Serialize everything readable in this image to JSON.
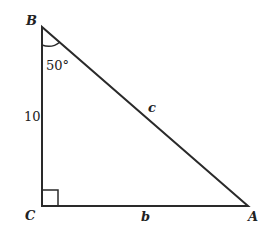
{
  "diagram": {
    "type": "right-triangle",
    "vertices": {
      "B": {
        "label": "B",
        "x": 42,
        "y": 27
      },
      "C": {
        "label": "C",
        "x": 42,
        "y": 206
      },
      "A": {
        "label": "A",
        "x": 248,
        "y": 206
      }
    },
    "sides": {
      "BC": {
        "label": "10"
      },
      "AB": {
        "label": "c"
      },
      "CA": {
        "label": "b"
      }
    },
    "angle_B": {
      "label": "50°"
    },
    "right_angle_at": "C",
    "colors": {
      "stroke": "#2a2a2a",
      "background": "#ffffff"
    }
  }
}
